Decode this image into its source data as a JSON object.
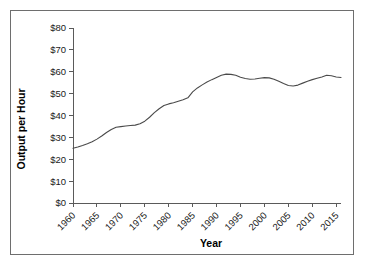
{
  "figure": {
    "border_color": "#6e6e6e",
    "background": "#ffffff"
  },
  "chart_data": {
    "type": "line",
    "title": "",
    "xlabel": "Year",
    "ylabel": "Output per Hour",
    "xlim": [
      1960,
      2016
    ],
    "ylim": [
      0,
      80
    ],
    "grid": false,
    "legend": null,
    "line_color": "#4a4a4a",
    "x_tick_labels": [
      "1960",
      "1965",
      "1970",
      "1975",
      "1980",
      "1985",
      "1990",
      "1995",
      "2000",
      "2005",
      "2010",
      "2015"
    ],
    "x_ticks": [
      1960,
      1965,
      1970,
      1975,
      1980,
      1985,
      1990,
      1995,
      2000,
      2005,
      2010,
      2015
    ],
    "y_tick_labels": [
      "$0",
      "$10",
      "$20",
      "$30",
      "$40",
      "$50",
      "$60",
      "$70",
      "$80"
    ],
    "y_ticks": [
      0,
      10,
      20,
      30,
      40,
      50,
      60,
      70,
      80
    ],
    "x": [
      1960,
      1961,
      1962,
      1963,
      1964,
      1965,
      1966,
      1967,
      1968,
      1969,
      1970,
      1971,
      1972,
      1973,
      1974,
      1975,
      1976,
      1977,
      1978,
      1979,
      1980,
      1981,
      1982,
      1983,
      1984,
      1985,
      1986,
      1987,
      1988,
      1989,
      1990,
      1991,
      1992,
      1993,
      1994,
      1995,
      1996,
      1997,
      1998,
      1999,
      2000,
      2001,
      2002,
      2003,
      2004,
      2005,
      2006,
      2007,
      2008,
      2009,
      2010,
      2011,
      2012,
      2013,
      2014,
      2015,
      2016
    ],
    "values": [
      25.0,
      25.6,
      26.3,
      27.1,
      28.0,
      29.2,
      30.6,
      32.2,
      33.6,
      34.6,
      34.9,
      35.2,
      35.4,
      35.6,
      36.2,
      37.4,
      39.2,
      41.3,
      43.1,
      44.6,
      45.3,
      45.8,
      46.5,
      47.2,
      48.1,
      50.8,
      52.6,
      54.0,
      55.3,
      56.4,
      57.4,
      58.4,
      58.9,
      58.8,
      58.4,
      57.5,
      56.9,
      56.6,
      56.7,
      57.0,
      57.3,
      57.2,
      56.6,
      55.6,
      54.6,
      53.7,
      53.5,
      53.9,
      54.8,
      55.7,
      56.4,
      57.0,
      57.6,
      58.4,
      58.2,
      57.6,
      57.2
    ],
    "series_tail": {
      "x": [
        2016,
        2017,
        2018,
        2019,
        2020,
        2021,
        2022,
        2023,
        2024
      ],
      "values": [
        57.4,
        58.0,
        58.6,
        59.1,
        59.6,
        59.8,
        60.0,
        60.6,
        61.4
      ]
    }
  }
}
